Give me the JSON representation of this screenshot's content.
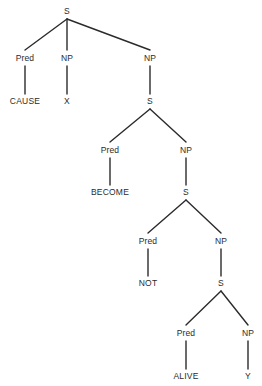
{
  "diagram": {
    "type": "constituency-tree",
    "width": 262,
    "height": 386,
    "background_color": "#ffffff",
    "line_color": "#2b2b2b",
    "text_color": "#2b2b2b",
    "nodes": [
      {
        "id": "s1",
        "label": "S",
        "x": 67,
        "y": 11,
        "kind": "category"
      },
      {
        "id": "pred1",
        "label": "Pred",
        "x": 25,
        "y": 58,
        "kind": "category"
      },
      {
        "id": "np1",
        "label": "NP",
        "x": 67,
        "y": 58,
        "kind": "category"
      },
      {
        "id": "np2",
        "label": "NP",
        "x": 150,
        "y": 58,
        "kind": "category"
      },
      {
        "id": "cause",
        "label": "CAUSE",
        "x": 25,
        "y": 101,
        "kind": "terminal"
      },
      {
        "id": "x",
        "label": "X",
        "x": 67,
        "y": 101,
        "kind": "terminal"
      },
      {
        "id": "s2",
        "label": "S",
        "x": 150,
        "y": 101,
        "kind": "category"
      },
      {
        "id": "pred2",
        "label": "Pred",
        "x": 110,
        "y": 150,
        "kind": "category"
      },
      {
        "id": "np3",
        "label": "NP",
        "x": 186,
        "y": 150,
        "kind": "category"
      },
      {
        "id": "become",
        "label": "BECOME",
        "x": 110,
        "y": 192,
        "kind": "terminal"
      },
      {
        "id": "s3",
        "label": "S",
        "x": 186,
        "y": 192,
        "kind": "category"
      },
      {
        "id": "pred3",
        "label": "Pred",
        "x": 148,
        "y": 241,
        "kind": "category"
      },
      {
        "id": "np4",
        "label": "NP",
        "x": 221,
        "y": 241,
        "kind": "category"
      },
      {
        "id": "not",
        "label": "NOT",
        "x": 148,
        "y": 283,
        "kind": "terminal"
      },
      {
        "id": "s4",
        "label": "S",
        "x": 221,
        "y": 283,
        "kind": "category"
      },
      {
        "id": "pred4",
        "label": "Pred",
        "x": 186,
        "y": 333,
        "kind": "category"
      },
      {
        "id": "np5",
        "label": "NP",
        "x": 248,
        "y": 333,
        "kind": "category"
      },
      {
        "id": "alive",
        "label": "ALIVE",
        "x": 186,
        "y": 376,
        "kind": "terminal"
      },
      {
        "id": "y",
        "label": "Y",
        "x": 248,
        "y": 376,
        "kind": "terminal"
      }
    ],
    "edges": [
      {
        "from": "s1",
        "to": "pred1",
        "x1": 67,
        "y1": 19,
        "x2": 25,
        "y2": 50
      },
      {
        "from": "s1",
        "to": "np1",
        "x1": 67,
        "y1": 19,
        "x2": 67,
        "y2": 50
      },
      {
        "from": "s1",
        "to": "np2",
        "x1": 67,
        "y1": 19,
        "x2": 150,
        "y2": 50
      },
      {
        "from": "pred1",
        "to": "cause",
        "x1": 25,
        "y1": 66,
        "x2": 25,
        "y2": 94
      },
      {
        "from": "np1",
        "to": "x",
        "x1": 67,
        "y1": 66,
        "x2": 67,
        "y2": 94
      },
      {
        "from": "np2",
        "to": "s2",
        "x1": 150,
        "y1": 66,
        "x2": 150,
        "y2": 94
      },
      {
        "from": "s2",
        "to": "pred2",
        "x1": 150,
        "y1": 109,
        "x2": 110,
        "y2": 142
      },
      {
        "from": "s2",
        "to": "np3",
        "x1": 150,
        "y1": 109,
        "x2": 186,
        "y2": 142
      },
      {
        "from": "pred2",
        "to": "become",
        "x1": 110,
        "y1": 158,
        "x2": 110,
        "y2": 185
      },
      {
        "from": "np3",
        "to": "s3",
        "x1": 186,
        "y1": 158,
        "x2": 186,
        "y2": 185
      },
      {
        "from": "s3",
        "to": "pred3",
        "x1": 186,
        "y1": 200,
        "x2": 148,
        "y2": 233
      },
      {
        "from": "s3",
        "to": "np4",
        "x1": 186,
        "y1": 200,
        "x2": 221,
        "y2": 233
      },
      {
        "from": "pred3",
        "to": "not",
        "x1": 148,
        "y1": 249,
        "x2": 148,
        "y2": 276
      },
      {
        "from": "np4",
        "to": "s4",
        "x1": 221,
        "y1": 249,
        "x2": 221,
        "y2": 276
      },
      {
        "from": "s4",
        "to": "pred4",
        "x1": 221,
        "y1": 291,
        "x2": 186,
        "y2": 325
      },
      {
        "from": "s4",
        "to": "np5",
        "x1": 221,
        "y1": 291,
        "x2": 248,
        "y2": 325
      },
      {
        "from": "pred4",
        "to": "alive",
        "x1": 186,
        "y1": 341,
        "x2": 186,
        "y2": 369
      },
      {
        "from": "np5",
        "to": "y",
        "x1": 248,
        "y1": 341,
        "x2": 248,
        "y2": 369
      }
    ]
  }
}
